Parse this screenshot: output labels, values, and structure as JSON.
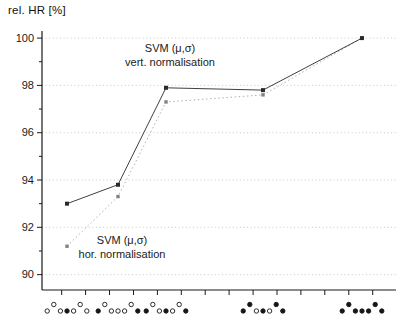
{
  "figure": {
    "y_axis_title": "rel. HR [%]"
  },
  "annotations": {
    "vert": {
      "line1": "SVM (μ,σ)",
      "line2": "vert. normalisation"
    },
    "hor": {
      "line1": "SVM (μ,σ)",
      "line2": "hor. normalisation"
    }
  },
  "chart_data": {
    "type": "line",
    "title": "",
    "xlabel": "",
    "ylabel": "rel. HR [%]",
    "ylim": [
      89.35,
      100.3
    ],
    "yticks": [
      90,
      92,
      94,
      96,
      98,
      100
    ],
    "yticks_minor": [
      91,
      93,
      95,
      97,
      99
    ],
    "grid": "horizontal dotted gridlines at major y ticks",
    "legend": "inline text annotations next to each curve",
    "categories": [
      "mic-config-1: center filled, others open",
      "mic-config-2: both ends filled, others open",
      "mic-config-3: ends and center filled",
      "mic-config-4: ends, raised pair and center filled",
      "mic-config-5: all filled"
    ],
    "glyph_patterns": [
      "lhlLlhl",
      "LhlllhL",
      "LhlLlhL",
      "LHlLlHL",
      "LHLLLHL"
    ],
    "glyph_legend": {
      "l": "open circle, low row",
      "h": "open circle, raised row",
      "L": "filled circle, low row",
      "H": "filled circle, raised row"
    },
    "series": [
      {
        "name": "SVM (μ,σ) vert. normalisation",
        "values": [
          93.0,
          93.8,
          97.9,
          97.8,
          100.0
        ],
        "style": "solid",
        "color": "#404040",
        "marker_color": "#2a2a2a",
        "marker": "square"
      },
      {
        "name": "SVM (μ,σ) hor. normalisation",
        "values": [
          91.2,
          93.3,
          97.3,
          97.6,
          100.0
        ],
        "style": "dotted",
        "color": "#b0b0b0",
        "marker_color": "#828282",
        "marker": "square"
      }
    ],
    "colors": {
      "axis": "#1a1a1a",
      "tick_label": "#1a1a1a",
      "gridline": "#c9c9c9",
      "glyph_fill": "#161616",
      "glyph_open_fill": "#ffffff"
    },
    "layout": {
      "plot": {
        "left": 42,
        "top": 31,
        "right": 396,
        "bottom": 290
      },
      "x_px": [
        67,
        118,
        166,
        263,
        362
      ],
      "xticks_px": [
        61.7,
        85.6,
        109.5,
        133.5,
        157.4,
        181.3,
        205.2,
        229.1,
        253.1,
        277.0,
        300.9,
        324.8,
        348.8,
        372.7
      ],
      "glyph_row_y_low": 311,
      "glyph_row_y_high": 304.5,
      "glyph_spacing": 6.6,
      "glyph_radius": 2.2
    }
  }
}
